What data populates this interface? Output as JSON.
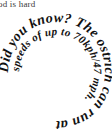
{
  "page": {
    "width": 112,
    "height": 129,
    "background_color": "#ffffff",
    "text_color": "#111111"
  },
  "clipped_text": {
    "content": "od is hard",
    "note": "partially cropped line of body text at top-left edge",
    "color": "#3a3a3a"
  },
  "spiral": {
    "full_text": "Did you know? The ostrich can run at speeds of up to 70kph/47 mph.",
    "direction": "inward-clockwise",
    "turns": 2,
    "segments": [
      {
        "id": "seg-1",
        "text": "Did you know? The ostrich can run at"
      },
      {
        "id": "seg-2",
        "text": "speeds of up to 70kph/47 mph."
      }
    ],
    "words": [
      "Did",
      "you",
      "know?",
      "The",
      "ostrich",
      "can",
      "run",
      "at",
      "speeds",
      "of",
      "up",
      "to",
      "70kph/47",
      "mph."
    ],
    "facts": {
      "subject": "ostrich",
      "speed_kph": "70kph",
      "speed_mph": "47 mph",
      "question_lead": "Did you know?"
    },
    "font_size_outer": 14,
    "font_size_inner": 11
  }
}
